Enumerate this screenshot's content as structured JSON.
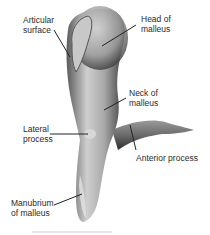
{
  "figure": {
    "labels": {
      "articular_surface": "Articular\nsurface",
      "head": "Head of\nmalleus",
      "neck": "Neck of\nmalleus",
      "lateral_process": "Lateral\nprocess",
      "anterior_process": "Anterior process",
      "manubrium": "Manubrium\nof malleus"
    },
    "colors": {
      "bone_light": "#d9d9d9",
      "bone_mid": "#9a9a9a",
      "bone_dark": "#3c3c3c",
      "leader_line": "#222222",
      "text": "#2a2a2a"
    }
  }
}
